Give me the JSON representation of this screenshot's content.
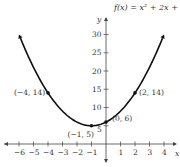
{
  "chart_data": {
    "type": "line",
    "title": "f(x) = x² + 2x + 6",
    "function": "x^2 + 2x + 6",
    "xlabel": "x",
    "ylabel": "y",
    "xlim": [
      -6.5,
      4.7
    ],
    "ylim": [
      -3,
      33
    ],
    "x_ticks": [
      -6,
      -5,
      -4,
      -3,
      -2,
      -1,
      1,
      2,
      3,
      4
    ],
    "y_ticks": [
      5,
      10,
      15,
      20,
      25,
      30
    ],
    "grid": false,
    "points": [
      {
        "x": -4,
        "y": 14,
        "label": "(−4, 14)"
      },
      {
        "x": -1,
        "y": 5,
        "label": "(−1, 5)"
      },
      {
        "x": 0,
        "y": 6,
        "label": "(0, 6)"
      },
      {
        "x": 2,
        "y": 14,
        "label": "(2, 14)"
      }
    ],
    "curve_x_range": [
      -5.9,
      3.9
    ]
  }
}
